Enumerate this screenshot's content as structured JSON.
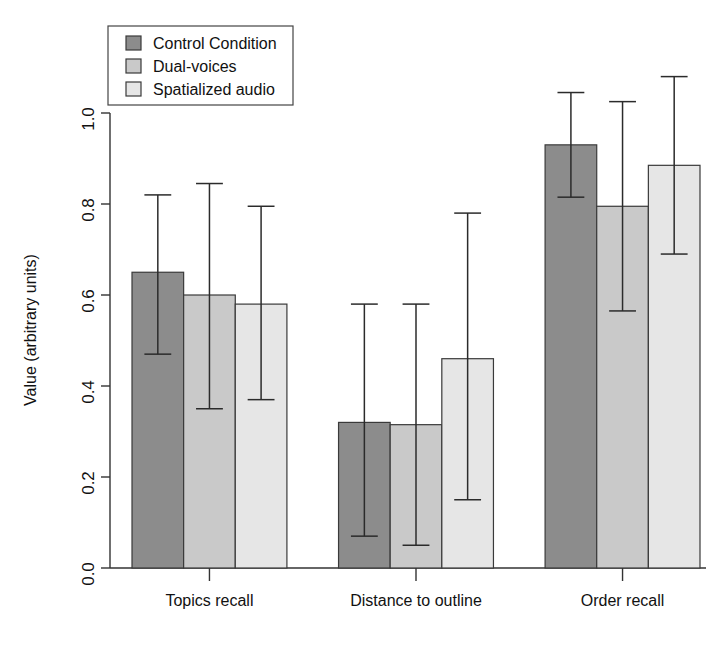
{
  "chart_data": {
    "type": "bar",
    "title": "",
    "xlabel": "",
    "ylabel": "Value (arbitrary units)",
    "ylim": [
      0.0,
      1.1
    ],
    "yticks": [
      0.0,
      0.2,
      0.4,
      0.6,
      0.8,
      1.0
    ],
    "ytick_labels": [
      "0.0",
      "0.2",
      "0.4",
      "0.6",
      "0.8",
      "1.0"
    ],
    "grid": false,
    "legend_position": "top-left",
    "error_bars": "symmetric-caps",
    "categories": [
      "Topics recall",
      "Distance to outline",
      "Order recall"
    ],
    "series": [
      {
        "name": "Control Condition",
        "color": "#8c8c8c",
        "values": [
          0.65,
          0.32,
          0.93
        ],
        "err_low": [
          0.47,
          0.07,
          0.815
        ],
        "err_high": [
          0.82,
          0.58,
          1.045
        ]
      },
      {
        "name": "Dual-voices",
        "color": "#c9c9c9",
        "values": [
          0.6,
          0.315,
          0.795
        ],
        "err_low": [
          0.35,
          0.05,
          0.565
        ],
        "err_high": [
          0.845,
          0.58,
          1.025
        ]
      },
      {
        "name": "Spatialized audio",
        "color": "#e6e6e6",
        "values": [
          0.58,
          0.46,
          0.885
        ],
        "err_low": [
          0.37,
          0.15,
          0.69
        ],
        "err_high": [
          0.795,
          0.78,
          1.08
        ]
      }
    ]
  },
  "legend": {
    "items": [
      {
        "label": "Control Condition",
        "color": "#8c8c8c"
      },
      {
        "label": "Dual-voices",
        "color": "#c9c9c9"
      },
      {
        "label": "Spatialized audio",
        "color": "#e6e6e6"
      }
    ]
  },
  "axes": {
    "y_title": "Value (arbitrary units)",
    "y_tick_labels": [
      "0.0",
      "0.2",
      "0.4",
      "0.6",
      "0.8",
      "1.0"
    ],
    "x_tick_labels": [
      "Topics recall",
      "Distance to outline",
      "Order recall"
    ]
  }
}
